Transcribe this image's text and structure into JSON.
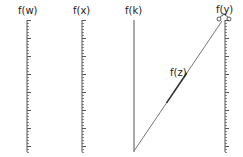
{
  "diagram": {
    "type": "nomogram",
    "colors": {
      "background": "#ffffff",
      "axis": "#555555",
      "line": "#777777",
      "label": "#222222"
    },
    "axes": [
      {
        "id": "w",
        "label": "f(w)",
        "x": 27,
        "y_top": 20,
        "y_bottom": 152,
        "ticks": true
      },
      {
        "id": "x",
        "label": "f(x)",
        "x": 82,
        "y_top": 20,
        "y_bottom": 152,
        "ticks": true
      },
      {
        "id": "k",
        "label": "f(k)",
        "x": 134,
        "y_top": 20,
        "y_bottom": 152,
        "ticks": false
      },
      {
        "id": "y",
        "label": "f(y)",
        "x": 225,
        "y_top": 20,
        "y_bottom": 152,
        "ticks": true
      }
    ],
    "connector": {
      "label": "f(z)",
      "from": {
        "x": 134,
        "y": 151
      },
      "to": {
        "x": 222,
        "y": 21
      },
      "highlight": {
        "from_t": 0.37,
        "to_t": 0.6
      }
    },
    "labels": {
      "w": "f(w)",
      "x": "f(x)",
      "k": "f(k)",
      "y": "f(y)",
      "z": "f(z)"
    }
  }
}
